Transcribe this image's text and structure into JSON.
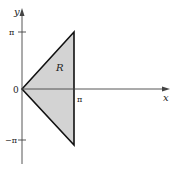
{
  "diagram": {
    "type": "region-plot",
    "axes": {
      "x_label": "x",
      "y_label": "y",
      "origin_label": "0",
      "x_ticks": [
        {
          "label": "π",
          "value": "pi"
        }
      ],
      "y_ticks": [
        {
          "label": "π",
          "value": "pi"
        },
        {
          "label": "−π",
          "value": "-pi"
        }
      ]
    },
    "region": {
      "label": "R",
      "vertices": [
        [
          "0",
          "0"
        ],
        [
          "π",
          "π"
        ],
        [
          "π",
          "−π"
        ]
      ],
      "fill_color": "#d3d3d3",
      "stroke_color": "#111111"
    }
  }
}
